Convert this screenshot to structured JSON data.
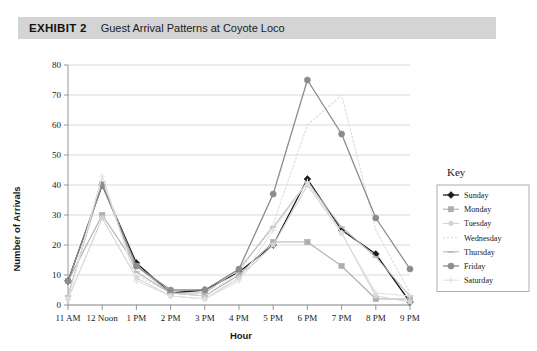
{
  "header": {
    "exhibit_label": "EXHIBIT 2",
    "title": "Guest Arrival Patterns at Coyote Loco",
    "band_color": "#d4d4d4"
  },
  "legend": {
    "title": "Key"
  },
  "chart_data": {
    "type": "line",
    "title": "Guest Arrival Patterns at Coyote Loco",
    "xlabel": "Hour",
    "ylabel": "Number of Arrivals",
    "ylim": [
      0,
      80
    ],
    "yticks": [
      0,
      10,
      20,
      30,
      40,
      50,
      60,
      70,
      80
    ],
    "grid": true,
    "legend_position": "right",
    "categories": [
      "11 AM",
      "12 Noon",
      "1 PM",
      "2 PM",
      "3 PM",
      "4 PM",
      "5 PM",
      "6 PM",
      "7 PM",
      "8 PM",
      "9 PM"
    ],
    "series": [
      {
        "name": "Sunday",
        "color": "#1c1c1c",
        "marker": "diamond",
        "dash": "none",
        "width": 1.3,
        "values": [
          8,
          40,
          14,
          4,
          5,
          11,
          20,
          42,
          25,
          17,
          1
        ]
      },
      {
        "name": "Monday",
        "color": "#aeaeae",
        "marker": "square",
        "dash": "none",
        "width": 1.1,
        "values": [
          8,
          30,
          13,
          4,
          3,
          10,
          21,
          21,
          13,
          2,
          2
        ]
      },
      {
        "name": "Tuesday",
        "color": "#d3d3d3",
        "marker": "dot",
        "dash": "none",
        "width": 1.1,
        "values": [
          2,
          29,
          9,
          3,
          2,
          9,
          20,
          40,
          24,
          3,
          1
        ]
      },
      {
        "name": "Wednesday",
        "color": "#dcdcdc",
        "marker": "none",
        "dash": "2,2",
        "width": 1.1,
        "values": [
          3,
          43,
          10,
          4,
          3,
          11,
          27,
          60,
          70,
          25,
          4
        ]
      },
      {
        "name": "Thursday",
        "color": "#b8b8b8",
        "marker": "tick",
        "dash": "none",
        "width": 1.1,
        "values": [
          3,
          41,
          11,
          4,
          4,
          12,
          26,
          41,
          26,
          16,
          3
        ]
      },
      {
        "name": "Friday",
        "color": "#8c8c8c",
        "marker": "circle",
        "dash": "none",
        "width": 1.3,
        "values": [
          8,
          40,
          13,
          5,
          5,
          12,
          37,
          75,
          57,
          29,
          12
        ]
      },
      {
        "name": "Saturday",
        "color": "#e2e2e2",
        "marker": "plus",
        "dash": "none",
        "width": 1.1,
        "values": [
          2,
          43,
          8,
          3,
          2,
          8,
          25,
          41,
          24,
          4,
          3
        ]
      }
    ]
  }
}
